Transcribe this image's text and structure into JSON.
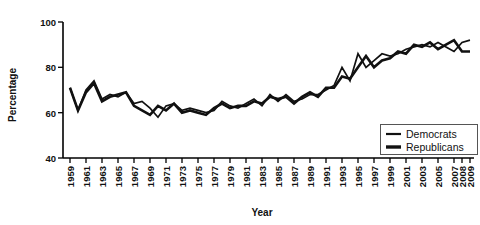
{
  "chart_data": {
    "type": "line",
    "title": "",
    "xlabel": "Year",
    "ylabel": "Percentage",
    "ylim": [
      40,
      100
    ],
    "yticks": [
      40,
      60,
      80,
      100
    ],
    "xlim": [
      1959,
      2009
    ],
    "grid": false,
    "legend_position": "bottom-right",
    "x": [
      1959,
      1960,
      1961,
      1962,
      1963,
      1964,
      1965,
      1966,
      1967,
      1968,
      1969,
      1970,
      1971,
      1972,
      1973,
      1974,
      1975,
      1976,
      1977,
      1978,
      1979,
      1980,
      1981,
      1982,
      1983,
      1984,
      1985,
      1986,
      1987,
      1988,
      1989,
      1990,
      1991,
      1992,
      1993,
      1994,
      1995,
      1996,
      1997,
      1998,
      1999,
      2000,
      2001,
      2002,
      2003,
      2004,
      2005,
      2006,
      2007,
      2008,
      2009
    ],
    "xtick_labels": [
      "1959",
      "1961",
      "1963",
      "1965",
      "1967",
      "1969",
      "1971",
      "1973",
      "1975",
      "1977",
      "1979",
      "1981",
      "1983",
      "1985",
      "1987",
      "1989",
      "1991",
      "1993",
      "1995",
      "1997",
      "1999",
      "2001",
      "2003",
      "2005",
      "2007",
      "2008",
      "2009"
    ],
    "series": [
      {
        "name": "Democrats",
        "color": "#111111",
        "values": [
          71,
          61,
          70,
          74,
          66,
          68,
          67,
          69,
          64,
          65,
          62,
          58,
          63,
          64,
          61,
          62,
          61,
          60,
          61,
          65,
          63,
          62,
          64,
          66,
          63,
          68,
          65,
          68,
          65,
          66,
          68,
          68,
          70,
          72,
          80,
          74,
          86,
          80,
          83,
          86,
          85,
          86,
          88,
          89,
          90,
          89,
          91,
          89,
          87,
          91,
          92
        ]
      },
      {
        "name": "Republicans",
        "color": "#111111",
        "values": [
          71,
          61,
          69,
          73,
          65,
          67,
          68,
          69,
          63,
          61,
          59,
          63,
          61,
          64,
          60,
          61,
          60,
          59,
          62,
          64,
          62,
          63,
          63,
          65,
          64,
          67,
          66,
          67,
          64,
          67,
          69,
          67,
          71,
          71,
          76,
          75,
          80,
          85,
          80,
          83,
          84,
          87,
          86,
          90,
          89,
          91,
          88,
          90,
          92,
          87,
          87
        ]
      }
    ]
  },
  "axes": {
    "y_axis_title": "Percentage",
    "x_axis_title": "Year",
    "y_tick_labels": [
      "100",
      "80",
      "60",
      "40"
    ]
  },
  "legend": {
    "items": [
      {
        "label": "Democrats",
        "swatch": "thin-line-swatch"
      },
      {
        "label": "Republicans",
        "swatch": "thick-line-swatch"
      }
    ]
  }
}
